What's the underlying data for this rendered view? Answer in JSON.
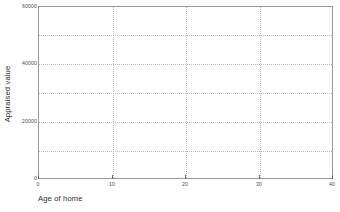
{
  "chart_data": {
    "type": "scatter",
    "title": "",
    "subtitle": "",
    "xlabel": "Age of home",
    "ylabel": "Appraised value",
    "xlim": [
      0,
      40
    ],
    "ylim": [
      0,
      60000
    ],
    "x_ticks": [
      {
        "value": 0,
        "label": "0"
      },
      {
        "value": 10,
        "label": "10"
      },
      {
        "value": 20,
        "label": "20"
      },
      {
        "value": 30,
        "label": "30"
      },
      {
        "value": 40,
        "label": "40"
      }
    ],
    "y_ticks": [
      {
        "value": 0,
        "label": "0"
      },
      {
        "value": 20000,
        "label": "20000"
      },
      {
        "value": 40000,
        "label": "40000"
      },
      {
        "value": 60000,
        "label": "60000"
      }
    ],
    "x_gridlines": [
      10,
      20,
      30
    ],
    "y_gridlines": [
      10000,
      20000,
      30000,
      40000,
      50000
    ],
    "grid": true,
    "grid_style": "dotted",
    "legend": null,
    "legend_position": "none",
    "series": [
      {
        "name": "Appraised value vs Age of home",
        "x": [],
        "y": []
      }
    ],
    "annotations": [],
    "colors": {
      "background": "#ffffff",
      "plot_background": "#ffffff",
      "frame": "#9a9a9a",
      "grid": "#b9b9b9",
      "tick_label": "#4a4a4a",
      "axis_title": "#2e2e2e"
    }
  }
}
